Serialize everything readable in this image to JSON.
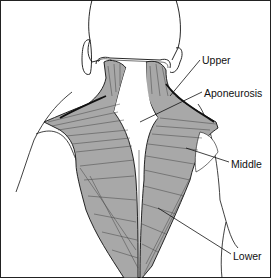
{
  "figure": {
    "labels": [
      {
        "id": "upper",
        "text": "Upper",
        "x": 202,
        "y": 55
      },
      {
        "id": "aponeurosis",
        "text": "Aponeurosis",
        "x": 204,
        "y": 88
      },
      {
        "id": "middle",
        "text": "Middle",
        "x": 231,
        "y": 159
      },
      {
        "id": "lower",
        "text": "Lower",
        "x": 233,
        "y": 251
      }
    ]
  },
  "colors": {
    "ink": "#111111",
    "muscle_fill": "#a8a8a8",
    "muscle_dark": "#4a4a4a",
    "skin": "#ffffff",
    "border": "#222222"
  }
}
